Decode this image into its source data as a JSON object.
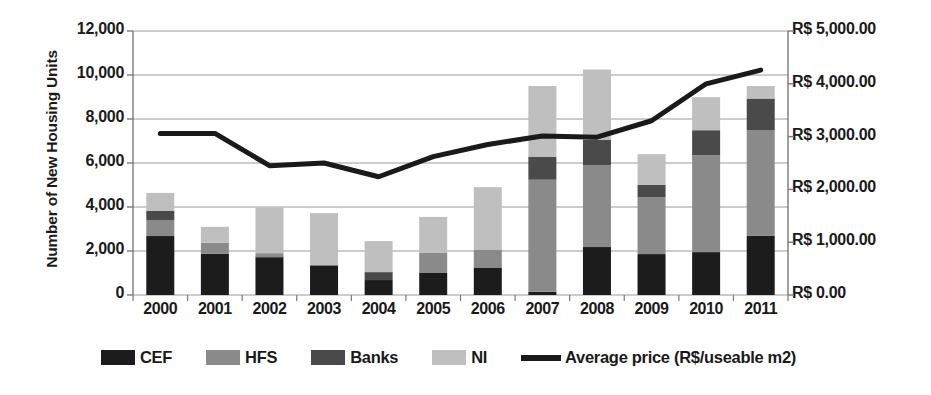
{
  "chart_data": {
    "type": "bar",
    "subtype": "stacked-bar-with-line-overlay",
    "title": "",
    "xlabel": "",
    "ylabel": "Number of New Housing Units",
    "y2label": "",
    "categories": [
      "2000",
      "2001",
      "2002",
      "2003",
      "2004",
      "2005",
      "2006",
      "2007",
      "2008",
      "2009",
      "2010",
      "2011"
    ],
    "ylim": [
      0,
      12000
    ],
    "y2lim": [
      0,
      5000
    ],
    "y_ticks": [
      "0",
      "2,000",
      "4,000",
      "6,000",
      "8,000",
      "10,000",
      "12,000"
    ],
    "y_tick_values": [
      0,
      2000,
      4000,
      6000,
      8000,
      10000,
      12000
    ],
    "y2_ticks": [
      "R$ 0.00",
      "R$ 1,000.00",
      "R$ 2,000.00",
      "R$ 3,000.00",
      "R$ 4,000.00",
      "R$ 5,000.00"
    ],
    "y2_tick_values": [
      0,
      1000,
      2000,
      3000,
      4000,
      5000
    ],
    "grid": true,
    "legend_position": "bottom",
    "series": [
      {
        "name": "CEF",
        "type": "bar",
        "color": "#1c1c1c",
        "axis": "left",
        "values": [
          2680,
          1880,
          1720,
          1350,
          680,
          1000,
          1250,
          150,
          2180,
          1860,
          1950,
          2700
        ]
      },
      {
        "name": "HFS",
        "type": "bar",
        "color": "#8a8a8a",
        "axis": "left",
        "values": [
          730,
          500,
          180,
          0,
          0,
          910,
          820,
          5090,
          3730,
          2590,
          4400,
          4780
        ]
      },
      {
        "name": "Banks",
        "type": "bar",
        "color": "#4a4a4a",
        "axis": "left",
        "values": [
          410,
          0,
          0,
          0,
          360,
          0,
          0,
          1050,
          1140,
          550,
          1140,
          1450
        ]
      },
      {
        "name": "NI",
        "type": "bar",
        "color": "#bfbfbf",
        "axis": "left",
        "values": [
          820,
          720,
          2080,
          2370,
          1410,
          1640,
          2830,
          3210,
          3200,
          1400,
          1500,
          570
        ]
      },
      {
        "name": "Average price (R$/useable m2)",
        "type": "line",
        "color": "#1a1a1a",
        "axis": "right",
        "values": [
          3060,
          3060,
          2450,
          2500,
          2240,
          2620,
          2850,
          3010,
          2990,
          3300,
          4000,
          4260
        ]
      }
    ],
    "bar_totals": [
      4640,
      3100,
      3980,
      3720,
      2450,
      3550,
      4900,
      9500,
      10250,
      5800,
      8990,
      9500
    ]
  },
  "legend": {
    "items": [
      {
        "label": "CEF",
        "swatch": "#1c1c1c",
        "marker": "square"
      },
      {
        "label": "HFS",
        "swatch": "#8a8a8a",
        "marker": "square"
      },
      {
        "label": "Banks",
        "swatch": "#4a4a4a",
        "marker": "square"
      },
      {
        "label": "NI",
        "swatch": "#bfbfbf",
        "marker": "square"
      },
      {
        "label": "Average price (R$/useable m2)",
        "swatch": "#1a1a1a",
        "marker": "line"
      }
    ]
  }
}
